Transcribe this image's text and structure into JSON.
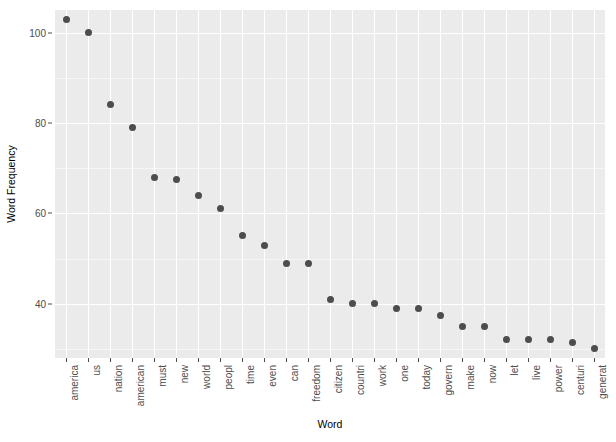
{
  "chart_data": {
    "type": "scatter",
    "title": "",
    "xlabel": "Word",
    "ylabel": "Word Frequency",
    "categories": [
      "america",
      "us",
      "nation",
      "american",
      "must",
      "new",
      "world",
      "peopl",
      "time",
      "even",
      "can",
      "freedom",
      "citizen",
      "countri",
      "work",
      "one",
      "today",
      "govern",
      "make",
      "now",
      "let",
      "live",
      "power",
      "centuri",
      "generat"
    ],
    "values": [
      103,
      100,
      84,
      79,
      68,
      67.5,
      64,
      61,
      55,
      53,
      49,
      49,
      41,
      40,
      40,
      39,
      39,
      37.5,
      35,
      35,
      32,
      32,
      32,
      31.5,
      30
    ],
    "ylim": [
      28,
      105
    ],
    "yticks": [
      40,
      60,
      80,
      100
    ],
    "ytick_labels": [
      "40",
      "60",
      "80",
      "100"
    ],
    "y_minor_ticks": [
      30,
      50,
      70,
      90
    ],
    "grid": true,
    "legend": "none",
    "panel_background": "#ebebeb",
    "point_color": "#4d4d4d",
    "gridline_color": "#ffffff"
  }
}
